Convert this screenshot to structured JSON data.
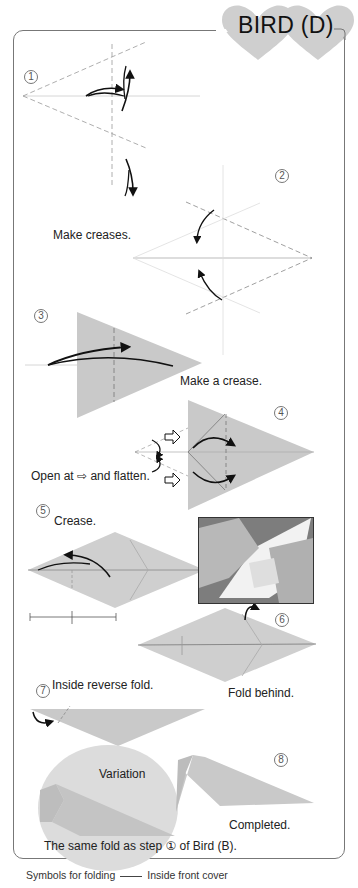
{
  "header": {
    "title": "BIRD (D)"
  },
  "steps": [
    {
      "number": "1",
      "caption": "Make creases."
    },
    {
      "number": "2",
      "caption": ""
    },
    {
      "number": "3",
      "caption": "Make a crease."
    },
    {
      "number": "4",
      "caption": "Open at ⇨ and flatten."
    },
    {
      "number": "5",
      "caption": "Crease."
    },
    {
      "number": "6",
      "caption": "Fold behind."
    },
    {
      "number": "7",
      "caption": "Inside reverse fold."
    },
    {
      "number": "8",
      "caption": "Completed."
    }
  ],
  "variation": {
    "label": "Variation",
    "note": "The same fold as step ① of Bird (B)."
  },
  "footer": {
    "symbols_label": "Symbols for folding",
    "reference": "Inside front cover"
  },
  "colors": {
    "paper": "#c9c9c9",
    "variation_bg": "#dcdcdc",
    "frame": "#777777",
    "heart": "#cfcfcf"
  }
}
